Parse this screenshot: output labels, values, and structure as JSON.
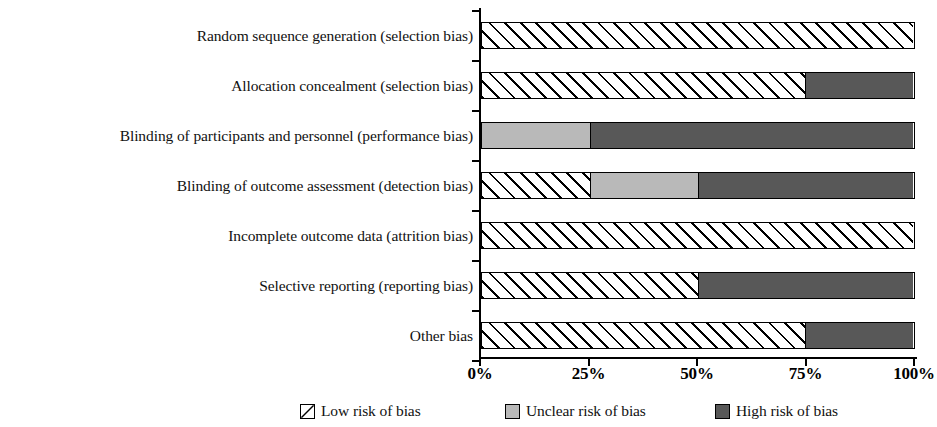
{
  "chart_data": {
    "type": "bar",
    "orientation": "horizontal",
    "stacked": true,
    "stacked_percent": true,
    "title": "",
    "xlabel": "",
    "ylabel": "",
    "xlim": [
      0,
      100
    ],
    "grid": false,
    "legend_position": "bottom",
    "categories": [
      "Random sequence generation (selection bias)",
      "Allocation concealment (selection bias)",
      "Blinding of participants and personnel (performance bias)",
      "Blinding of outcome assessment (detection bias)",
      "Incomplete outcome data (attrition bias)",
      "Selective reporting (reporting bias)",
      "Other bias"
    ],
    "series": [
      {
        "name": "Low risk of bias",
        "key": "low",
        "fill": "white-diagonal-hatch",
        "color": "#ffffff",
        "values": [
          100,
          75,
          0,
          25,
          100,
          50,
          75
        ]
      },
      {
        "name": "Unclear risk of bias",
        "key": "unclear",
        "fill": "solid",
        "color": "#b9b9b9",
        "values": [
          0,
          0,
          25,
          25,
          0,
          0,
          0
        ]
      },
      {
        "name": "High risk of bias",
        "key": "high",
        "fill": "solid",
        "color": "#585858",
        "values": [
          0,
          25,
          75,
          50,
          0,
          50,
          25
        ]
      }
    ],
    "xticks": [
      {
        "value": 0,
        "label": "0%"
      },
      {
        "value": 25,
        "label": "25%"
      },
      {
        "value": 50,
        "label": "50%"
      },
      {
        "value": 75,
        "label": "75%"
      },
      {
        "value": 100,
        "label": "100%"
      }
    ]
  },
  "legend": {
    "items": [
      {
        "label": "Low risk of bias",
        "key": "low"
      },
      {
        "label": "Unclear risk of bias",
        "key": "unclear"
      },
      {
        "label": "High risk of bias",
        "key": "high"
      }
    ]
  },
  "colors": {
    "low": "#ffffff",
    "unclear": "#b9b9b9",
    "high": "#585858",
    "axis": "#000000",
    "text": "#111111",
    "background": "#ffffff"
  }
}
